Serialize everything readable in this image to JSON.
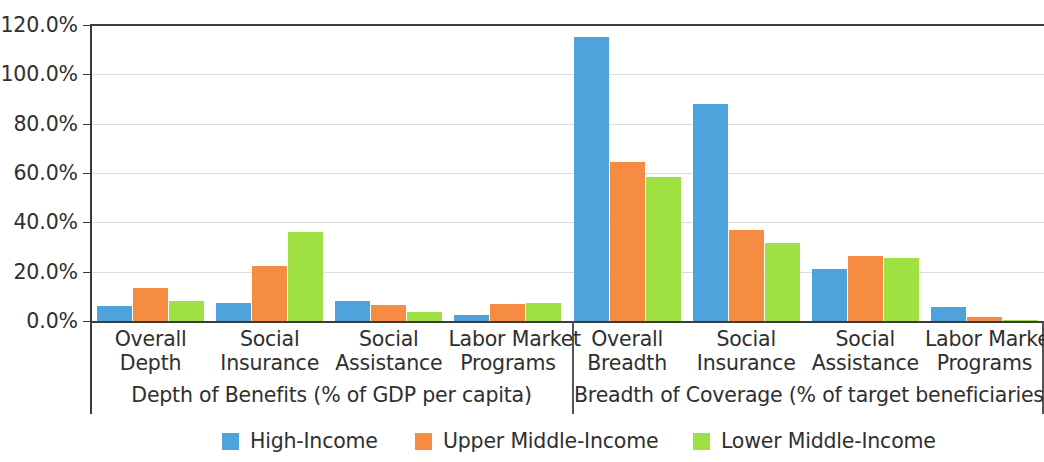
{
  "chart_data": {
    "type": "bar",
    "title": "",
    "subtitle": "",
    "xlabel": "",
    "ylabel": "",
    "ylim": [
      0,
      120
    ],
    "ytick_labels": [
      "0.0%",
      "20.0%",
      "40.0%",
      "60.0%",
      "80.0%",
      "100.0%",
      "120.0%"
    ],
    "ytick_values": [
      0,
      20,
      40,
      60,
      80,
      100,
      120
    ],
    "grid": true,
    "legend_position": "bottom",
    "categories": [
      "Overall Depth",
      "Social Insurance",
      "Social Assistance",
      "Labor Market Programs",
      "Overall Breadth",
      "Social Insurance",
      "Social Assistance",
      "Labor Market Programs"
    ],
    "series": [
      {
        "name": "High-Income",
        "color": "#4FA3DC",
        "values": [
          6.2,
          7.5,
          8.0,
          2.3,
          115.3,
          88.0,
          21.2,
          5.8
        ]
      },
      {
        "name": "Upper Middle-Income",
        "color": "#F68C42",
        "values": [
          13.3,
          22.2,
          6.3,
          7.0,
          64.3,
          37.0,
          26.5,
          1.5
        ]
      },
      {
        "name": "Lower Middle-Income",
        "color": "#9FE043",
        "values": [
          8.0,
          36.2,
          3.5,
          7.5,
          58.3,
          31.8,
          25.5,
          0.3
        ]
      }
    ],
    "groups": [
      {
        "caption": "Depth of Benefits (% of GDP per capita)",
        "categories": [
          {
            "line1": "Overall",
            "line2": "Depth"
          },
          {
            "line1": "Social",
            "line2": "Insurance"
          },
          {
            "line1": "Social",
            "line2": "Assistance"
          },
          {
            "line1": "Labor Market",
            "line2": "Programs"
          }
        ]
      },
      {
        "caption": "Breadth of Coverage (% of target beneficiaries)",
        "categories": [
          {
            "line1": "Overall",
            "line2": "Breadth"
          },
          {
            "line1": "Social",
            "line2": "Insurance"
          },
          {
            "line1": "Social",
            "line2": "Assistance"
          },
          {
            "line1": "Labor Market",
            "line2": "Programs"
          }
        ]
      }
    ],
    "legend": [
      {
        "label": "High-Income",
        "color": "#4FA3DC"
      },
      {
        "label": "Upper Middle-Income",
        "color": "#F68C42"
      },
      {
        "label": "Lower Middle-Income",
        "color": "#9FE043"
      }
    ]
  }
}
